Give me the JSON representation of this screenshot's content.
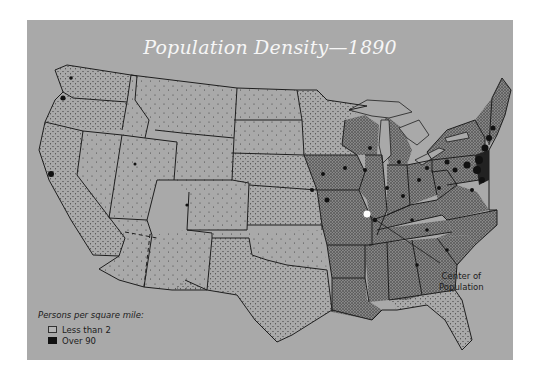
{
  "map": {
    "title": "Population Density—1890",
    "legend": {
      "heading": "Persons per square mile:",
      "items": [
        {
          "label": "Less than 2",
          "swatch": "#b5b5b5"
        },
        {
          "label": "Over 90",
          "swatch": "#111111"
        }
      ]
    },
    "annotation": {
      "line1": "Center of",
      "line2": "Population",
      "marker_color": "#ffffff"
    },
    "colors": {
      "background": "#a9a9a9",
      "state_border": "#1e1e1e",
      "dense": "#111111",
      "title": "#f6f6f6"
    }
  }
}
